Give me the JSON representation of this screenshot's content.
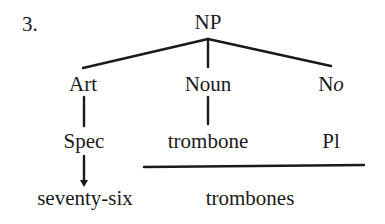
{
  "diagram": {
    "number": "3.",
    "root": "NP",
    "level1": {
      "art": "Art",
      "noun": "Noun",
      "no_prefix": "N",
      "no_suffix": "o"
    },
    "level2": {
      "spec": "Spec",
      "trombone": "trombone",
      "pl": "Pl"
    },
    "level3": {
      "seventy_six": "seventy-six",
      "trombones": "trombones"
    }
  }
}
